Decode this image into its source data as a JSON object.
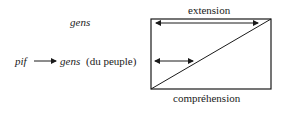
{
  "diagram": {
    "top_label": "gens",
    "left_source": "pif",
    "left_target_word": "gens",
    "left_target_gloss": "(du peuple)",
    "top_axis_label": "extension",
    "bottom_axis_label": "compréhension",
    "colors": {
      "ink": "#1a1a1a",
      "background": "#ffffff"
    }
  }
}
